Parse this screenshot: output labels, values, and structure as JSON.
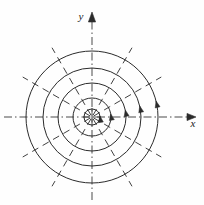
{
  "figure": {
    "background_color": "#fefefe",
    "ink_color": "#2b2b2b",
    "width": 204,
    "height": 205
  },
  "axes": {
    "origin": {
      "x": 92,
      "y": 117
    },
    "line_style": "dash-dot",
    "stroke_color": "#4a4a4a",
    "x_axis": {
      "label": "x",
      "label_position": {
        "x": 193,
        "y": 127
      },
      "start": {
        "x": 4,
        "y": 117
      },
      "end": {
        "x": 196,
        "y": 117
      },
      "arrow": "right"
    },
    "y_axis": {
      "label": "y",
      "label_position": {
        "x": 81,
        "y": 20
      },
      "start": {
        "x": 92,
        "y": 200
      },
      "end": {
        "x": 92,
        "y": 12
      },
      "arrow": "up"
    }
  },
  "chart_data": {
    "type": "line",
    "xlabel": "x",
    "ylabel": "y",
    "coordinate_system": "polar",
    "center": {
      "x": 92,
      "y": 117
    },
    "grid": true,
    "legend": "none",
    "circles": [
      {
        "name": "circle-1",
        "radius": 8,
        "direction": "counterclockwise",
        "arrow_angle_deg": 8
      },
      {
        "name": "circle-2",
        "radius": 19,
        "direction": "counterclockwise",
        "arrow_angle_deg": 10
      },
      {
        "name": "circle-3",
        "radius": 34,
        "direction": "counterclockwise",
        "arrow_angle_deg": 12
      },
      {
        "name": "circle-4",
        "radius": 49,
        "direction": "counterclockwise",
        "arrow_angle_deg": 13
      },
      {
        "name": "circle-5",
        "radius": 66,
        "direction": "counterclockwise",
        "arrow_angle_deg": 14
      }
    ],
    "radial_lines": {
      "count": 12,
      "spacing_deg": 30,
      "angles_deg": [
        0,
        30,
        60,
        90,
        120,
        150,
        180,
        210,
        240,
        270,
        300,
        330
      ],
      "style": "dashed",
      "inner_radius": 2,
      "outer_radius": 80
    },
    "xlim": [
      -92,
      104
    ],
    "ylim": [
      -88,
      117
    ]
  }
}
